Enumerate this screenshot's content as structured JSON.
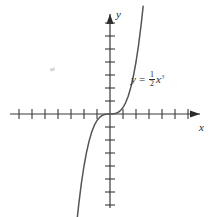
{
  "figure": {
    "background_color": "#ffffff",
    "line_color": "#3a3a3a",
    "text_color": "#1c1c1c"
  },
  "labels": {
    "x_axis": "x",
    "y_axis": "y",
    "equation_y": "y",
    "equation_equals": "=",
    "equation_numerator": "1",
    "equation_denominator": "2",
    "equation_variable": "x",
    "equation_exponent": "3",
    "equation_plain": "y = 1/2 x^3"
  },
  "chart_data": {
    "type": "line",
    "title": "",
    "subtitle": "",
    "xlabel": "x",
    "ylabel": "y",
    "annotations": [
      {
        "text": "y = 1/2 x^3",
        "x": 2.6,
        "y": 3.1
      }
    ],
    "legend": [],
    "legend_position": "none",
    "grid": false,
    "axis_style": "cartesian-arrows",
    "xlim": [
      -7.6,
      7.6
    ],
    "ylim": [
      -8.3,
      8.0
    ],
    "xticks": [
      -7,
      -6,
      -5,
      -4,
      -3,
      -2,
      -1,
      1,
      2,
      3,
      4,
      5,
      6,
      7
    ],
    "yticks": [
      -8,
      -7,
      -6,
      -5,
      -4,
      -3,
      -2,
      -1,
      1,
      2,
      3,
      4,
      5,
      6,
      7
    ],
    "xtick_labels": [],
    "ytick_labels": [],
    "series": [
      {
        "name": "y = 1/2 x^3",
        "equation": "y = 0.5 * x^3",
        "color": "#555555",
        "x": [
          -2.55,
          -2.4,
          -2.2,
          -2.0,
          -1.8,
          -1.6,
          -1.4,
          -1.2,
          -1.0,
          -0.8,
          -0.6,
          -0.4,
          -0.2,
          0.0,
          0.2,
          0.4,
          0.6,
          0.8,
          1.0,
          1.2,
          1.4,
          1.6,
          1.8,
          2.0,
          2.2,
          2.4,
          2.55
        ],
        "y": [
          -8.29,
          -6.91,
          -5.32,
          -4.0,
          -2.92,
          -2.05,
          -1.37,
          -0.86,
          -0.5,
          -0.26,
          -0.11,
          -0.03,
          -0.004,
          0.0,
          0.004,
          0.03,
          0.11,
          0.26,
          0.5,
          0.86,
          1.37,
          2.05,
          2.92,
          4.0,
          5.32,
          6.91,
          8.29
        ]
      }
    ]
  }
}
